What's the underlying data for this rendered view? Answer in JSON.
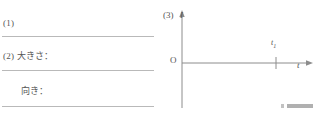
{
  "document": {
    "type": "worksheet-answer-area",
    "language": "ja"
  },
  "answers": {
    "rows": [
      {
        "label": "(1)",
        "indent": "none"
      },
      {
        "label": "(2) 大きさ：",
        "indent": "none"
      },
      {
        "label": "向き：",
        "indent": "indented"
      }
    ]
  },
  "graph": {
    "number": "(3)",
    "y_axis_label": "I",
    "x_axis_label": "t",
    "origin_label": "O",
    "tick_label": "t",
    "tick_subscript": "1",
    "axis_color": "#8c8c8c",
    "rule_color": "#b9b9b9",
    "text_color": "#555555"
  }
}
